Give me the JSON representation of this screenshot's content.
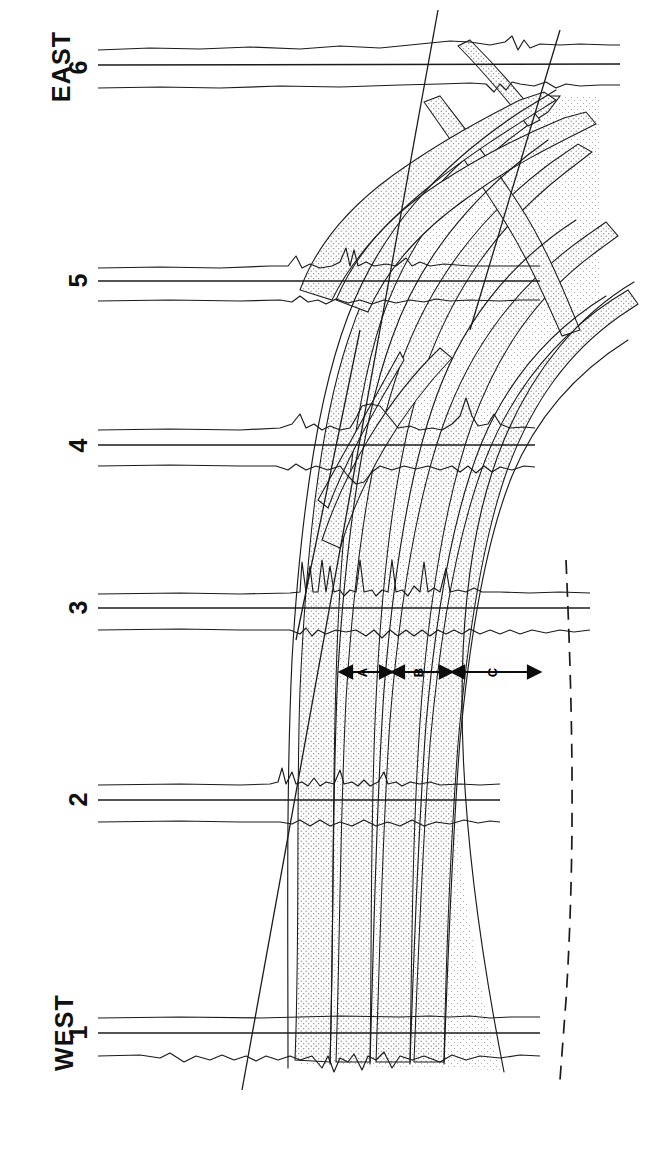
{
  "figure": {
    "kind": "stratigraphic-cross-section",
    "orientation": "rotated-90-ccw",
    "background_color": "#ffffff",
    "line_color": "#1a1a1a",
    "stipple_color": "#8a8a8a",
    "stipple_fill": "#f0f0f0"
  },
  "direction_labels": {
    "east": "EAST",
    "west": "WEST"
  },
  "wells": [
    {
      "id": "w6",
      "label": "6",
      "y": 65,
      "log_top": 48,
      "log_mid": 65,
      "log_bot": 88,
      "trace_end_x": 620
    },
    {
      "id": "w5",
      "label": "5",
      "y": 278,
      "log_top": 266,
      "log_mid": 281,
      "log_bot": 301,
      "trace_end_x": 540
    },
    {
      "id": "w4",
      "label": "4",
      "y": 443,
      "log_top": 428,
      "log_mid": 445,
      "log_bot": 466,
      "trace_end_x": 535
    },
    {
      "id": "w3",
      "label": "3",
      "y": 605,
      "log_top": 592,
      "log_mid": 608,
      "log_bot": 630,
      "trace_end_x": 590
    },
    {
      "id": "w2",
      "label": "2",
      "y": 797,
      "log_top": 783,
      "log_mid": 800,
      "log_bot": 822,
      "trace_end_x": 500
    },
    {
      "id": "w1",
      "label": "1",
      "y": 1030,
      "log_top": 1016,
      "log_mid": 1033,
      "log_bot": 1056,
      "trace_end_x": 540
    }
  ],
  "segment_markers": {
    "axis_y": 672,
    "items": [
      {
        "label": "A",
        "x_start": 340,
        "x_end": 392,
        "text_x": 362
      },
      {
        "label": "B",
        "x_start": 392,
        "x_end": 452,
        "text_x": 418
      },
      {
        "label": "C",
        "x_start": 452,
        "x_end": 540,
        "text_x": 492
      }
    ]
  },
  "annotations": {
    "dashed_boundary": "dashed fault / limit of correlation on lower right",
    "stipple_legend": "stippled bands denote correlated sand units"
  }
}
